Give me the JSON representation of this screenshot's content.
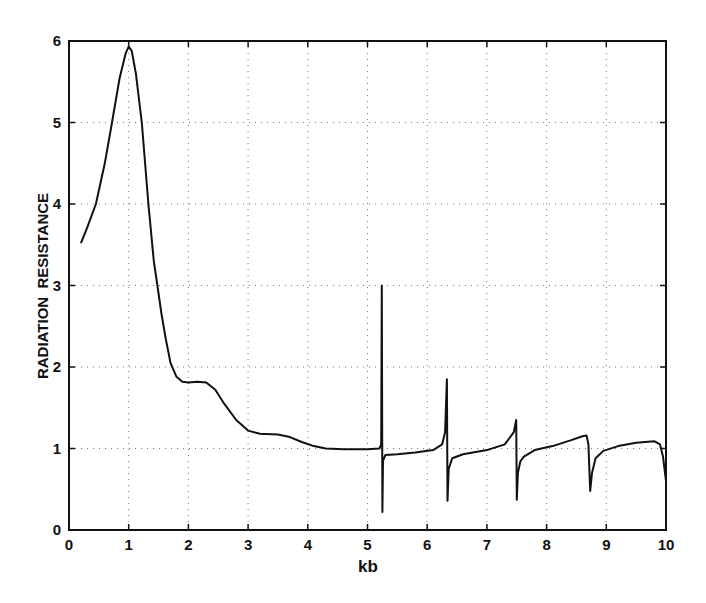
{
  "chart_data": {
    "type": "line",
    "title": "",
    "xlabel": "kb",
    "ylabel": "RADIATION  RESISTANCE",
    "xlim": [
      0,
      10
    ],
    "ylim": [
      0,
      6
    ],
    "xticks": [
      0,
      1,
      2,
      3,
      4,
      5,
      6,
      7,
      8,
      9,
      10
    ],
    "yticks": [
      0,
      1,
      2,
      3,
      4,
      5,
      6
    ],
    "grid": true,
    "grid_style": "dotted",
    "legend": null,
    "series": [
      {
        "name": "Radiation Resistance",
        "color": "#111111",
        "x": [
          0.2,
          0.3,
          0.45,
          0.6,
          0.72,
          0.85,
          0.95,
          1.0,
          1.05,
          1.12,
          1.22,
          1.33,
          1.42,
          1.48,
          1.55,
          1.62,
          1.7,
          1.8,
          1.9,
          2.0,
          2.15,
          2.3,
          2.45,
          2.6,
          2.8,
          3.0,
          3.2,
          3.5,
          3.7,
          3.9,
          4.1,
          4.3,
          4.6,
          5.0,
          5.2,
          5.23,
          5.24,
          5.25,
          5.26,
          5.3,
          5.5,
          5.8,
          6.1,
          6.25,
          6.3,
          6.33,
          6.34,
          6.36,
          6.42,
          6.6,
          7.0,
          7.3,
          7.45,
          7.49,
          7.5,
          7.52,
          7.56,
          7.62,
          7.8,
          8.1,
          8.4,
          8.6,
          8.67,
          8.7,
          8.73,
          8.76,
          8.82,
          8.95,
          9.2,
          9.5,
          9.8,
          9.9,
          9.95,
          10.0
        ],
        "y": [
          3.52,
          3.7,
          4.0,
          4.5,
          5.0,
          5.55,
          5.85,
          5.93,
          5.88,
          5.6,
          5.0,
          4.0,
          3.3,
          3.0,
          2.65,
          2.35,
          2.05,
          1.88,
          1.82,
          1.81,
          1.82,
          1.81,
          1.72,
          1.55,
          1.35,
          1.22,
          1.18,
          1.17,
          1.14,
          1.08,
          1.03,
          1.0,
          0.99,
          0.99,
          1.0,
          1.05,
          3.0,
          0.22,
          0.85,
          0.92,
          0.93,
          0.95,
          0.98,
          1.05,
          1.2,
          1.85,
          0.36,
          0.75,
          0.88,
          0.93,
          0.98,
          1.05,
          1.2,
          1.35,
          0.37,
          0.7,
          0.84,
          0.9,
          0.98,
          1.03,
          1.1,
          1.15,
          1.16,
          1.05,
          0.48,
          0.7,
          0.88,
          0.97,
          1.03,
          1.07,
          1.09,
          1.05,
          0.9,
          0.6
        ]
      }
    ]
  },
  "axes": {
    "xlabel": "kb",
    "ylabel": "RADIATION  RESISTANCE",
    "xtick_labels": [
      "0",
      "1",
      "2",
      "3",
      "4",
      "5",
      "6",
      "7",
      "8",
      "9",
      "10"
    ],
    "ytick_labels": [
      "0",
      "1",
      "2",
      "3",
      "4",
      "5",
      "6"
    ]
  }
}
